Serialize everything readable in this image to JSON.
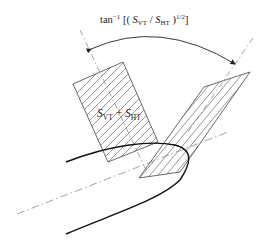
{
  "diagram": {
    "title": {
      "prefix": "tan",
      "exponent": "−1",
      "open": " [( ",
      "s1": "S",
      "s1_sub": "VT",
      "slash": " / ",
      "s2": "S",
      "s2_sub": "HT",
      "close": " )",
      "power": "1/2",
      "end": "]"
    },
    "shape_label": {
      "s1": "S",
      "s1_sub": "VT",
      "plus": " + ",
      "s2": "S",
      "s2_sub": "HT"
    },
    "elements": [
      "angle-arc-with-arrowheads",
      "left-dashed-axis",
      "right-dashed-axis",
      "hatched-rectangle-sum",
      "hatched-parallelogram-rotated",
      "centerline-dash-dot",
      "parabolic-tip-curve"
    ],
    "colors": {
      "ink": "#222222",
      "hatch": "#555555",
      "dashed": "#8a8a8a",
      "background": "#ffffff"
    }
  }
}
